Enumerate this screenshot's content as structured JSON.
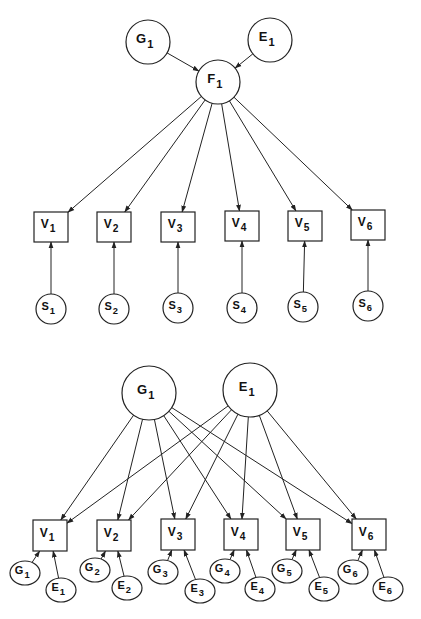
{
  "diagram_top": {
    "title": "Single-factor model",
    "latent": [
      {
        "id": "G1",
        "base": "G",
        "sub": "1",
        "cx": 148,
        "cy": 42,
        "rx": 22,
        "ry": 22
      },
      {
        "id": "E1",
        "base": "E",
        "sub": "1",
        "cx": 270,
        "cy": 40,
        "rx": 22,
        "ry": 22
      },
      {
        "id": "F1",
        "base": "F",
        "sub": "1",
        "cx": 218,
        "cy": 82,
        "rx": 22,
        "ry": 22
      }
    ],
    "observed": [
      {
        "id": "V1",
        "base": "V",
        "sub": "1",
        "cx": 51,
        "y": 212,
        "w": 34,
        "h": 30
      },
      {
        "id": "V2",
        "base": "V",
        "sub": "2",
        "cx": 114,
        "y": 212,
        "w": 34,
        "h": 30
      },
      {
        "id": "V3",
        "base": "V",
        "sub": "3",
        "cx": 178,
        "y": 212,
        "w": 34,
        "h": 30
      },
      {
        "id": "V4",
        "base": "V",
        "sub": "4",
        "cx": 242,
        "y": 211,
        "w": 34,
        "h": 30
      },
      {
        "id": "V5",
        "base": "V",
        "sub": "5",
        "cx": 305,
        "y": 211,
        "w": 34,
        "h": 30
      },
      {
        "id": "V6",
        "base": "V",
        "sub": "6",
        "cx": 368,
        "y": 210,
        "w": 34,
        "h": 30
      }
    ],
    "specific": [
      {
        "id": "S1",
        "base": "S",
        "sub": "1",
        "cx": 51,
        "cy": 309,
        "r": 15
      },
      {
        "id": "S2",
        "base": "S",
        "sub": "2",
        "cx": 114,
        "cy": 309,
        "r": 15
      },
      {
        "id": "S3",
        "base": "S",
        "sub": "3",
        "cx": 178,
        "cy": 308,
        "r": 15
      },
      {
        "id": "S4",
        "base": "S",
        "sub": "4",
        "cx": 242,
        "cy": 308,
        "r": 15
      },
      {
        "id": "S5",
        "base": "S",
        "sub": "5",
        "cx": 303,
        "cy": 307,
        "r": 15
      },
      {
        "id": "S6",
        "base": "S",
        "sub": "6",
        "cx": 368,
        "cy": 306,
        "r": 15
      }
    ],
    "edges": [
      {
        "from": "G1",
        "to": "F1"
      },
      {
        "from": "E1",
        "to": "F1"
      },
      {
        "from": "F1",
        "to": "V1"
      },
      {
        "from": "F1",
        "to": "V2"
      },
      {
        "from": "F1",
        "to": "V3"
      },
      {
        "from": "F1",
        "to": "V4"
      },
      {
        "from": "F1",
        "to": "V5"
      },
      {
        "from": "F1",
        "to": "V6"
      },
      {
        "from": "S1",
        "to": "V1"
      },
      {
        "from": "S2",
        "to": "V2"
      },
      {
        "from": "S3",
        "to": "V3"
      },
      {
        "from": "S4",
        "to": "V4"
      },
      {
        "from": "S5",
        "to": "V5"
      },
      {
        "from": "S6",
        "to": "V6"
      }
    ]
  },
  "diagram_bottom": {
    "title": "Two-factor (G, E) model",
    "latent": [
      {
        "id": "G1",
        "base": "G",
        "sub": "1",
        "cx": 149,
        "cy": 393,
        "rx": 27,
        "ry": 27
      },
      {
        "id": "E1",
        "base": "E",
        "sub": "1",
        "cx": 250,
        "cy": 390,
        "rx": 27,
        "ry": 27
      }
    ],
    "observed": [
      {
        "id": "V1",
        "base": "V",
        "sub": "1",
        "cx": 50,
        "y": 520,
        "w": 34,
        "h": 31
      },
      {
        "id": "V2",
        "base": "V",
        "sub": "2",
        "cx": 114,
        "y": 520,
        "w": 34,
        "h": 31
      },
      {
        "id": "V3",
        "base": "V",
        "sub": "3",
        "cx": 178,
        "y": 519,
        "w": 34,
        "h": 31
      },
      {
        "id": "V4",
        "base": "V",
        "sub": "4",
        "cx": 241,
        "y": 519,
        "w": 34,
        "h": 31
      },
      {
        "id": "V5",
        "base": "V",
        "sub": "5",
        "cx": 303,
        "y": 519,
        "w": 34,
        "h": 31
      },
      {
        "id": "V6",
        "base": "V",
        "sub": "6",
        "cx": 369,
        "y": 519,
        "w": 34,
        "h": 31
      }
    ],
    "residual_g": [
      {
        "id": "G1r",
        "base": "G",
        "sub": "1",
        "cx": 25,
        "cy": 573,
        "rx": 15,
        "ry": 12
      },
      {
        "id": "G2r",
        "base": "G",
        "sub": "2",
        "cx": 95,
        "cy": 570,
        "rx": 15,
        "ry": 12
      },
      {
        "id": "G3r",
        "base": "G",
        "sub": "3",
        "cx": 163,
        "cy": 572,
        "rx": 15,
        "ry": 12
      },
      {
        "id": "G4r",
        "base": "G",
        "sub": "4",
        "cx": 225,
        "cy": 571,
        "rx": 15,
        "ry": 12
      },
      {
        "id": "G5r",
        "base": "G",
        "sub": "5",
        "cx": 287,
        "cy": 571,
        "rx": 15,
        "ry": 12
      },
      {
        "id": "G6r",
        "base": "G",
        "sub": "6",
        "cx": 353,
        "cy": 572,
        "rx": 15,
        "ry": 12
      }
    ],
    "residual_e": [
      {
        "id": "E1r",
        "base": "E",
        "sub": "1",
        "cx": 61,
        "cy": 590,
        "rx": 15,
        "ry": 12
      },
      {
        "id": "E2r",
        "base": "E",
        "sub": "2",
        "cx": 127,
        "cy": 588,
        "rx": 15,
        "ry": 12
      },
      {
        "id": "E3r",
        "base": "E",
        "sub": "3",
        "cx": 200,
        "cy": 591,
        "rx": 15,
        "ry": 12
      },
      {
        "id": "E4r",
        "base": "E",
        "sub": "4",
        "cx": 260,
        "cy": 589,
        "rx": 15,
        "ry": 12
      },
      {
        "id": "E5r",
        "base": "E",
        "sub": "5",
        "cx": 324,
        "cy": 589,
        "rx": 15,
        "ry": 12
      },
      {
        "id": "E6r",
        "base": "E",
        "sub": "6",
        "cx": 388,
        "cy": 589,
        "rx": 15,
        "ry": 12
      }
    ],
    "edges": [
      {
        "from": "G1",
        "to": "V1"
      },
      {
        "from": "G1",
        "to": "V2"
      },
      {
        "from": "G1",
        "to": "V3"
      },
      {
        "from": "G1",
        "to": "V4"
      },
      {
        "from": "G1",
        "to": "V5"
      },
      {
        "from": "G1",
        "to": "V6"
      },
      {
        "from": "E1",
        "to": "V1"
      },
      {
        "from": "E1",
        "to": "V2"
      },
      {
        "from": "E1",
        "to": "V3"
      },
      {
        "from": "E1",
        "to": "V4"
      },
      {
        "from": "E1",
        "to": "V5"
      },
      {
        "from": "E1",
        "to": "V6"
      },
      {
        "from": "G1r",
        "to": "V1"
      },
      {
        "from": "E1r",
        "to": "V1"
      },
      {
        "from": "G2r",
        "to": "V2"
      },
      {
        "from": "E2r",
        "to": "V2"
      },
      {
        "from": "G3r",
        "to": "V3"
      },
      {
        "from": "E3r",
        "to": "V3"
      },
      {
        "from": "G4r",
        "to": "V4"
      },
      {
        "from": "E4r",
        "to": "V4"
      },
      {
        "from": "G5r",
        "to": "V5"
      },
      {
        "from": "E5r",
        "to": "V5"
      },
      {
        "from": "G6r",
        "to": "V6"
      },
      {
        "from": "E6r",
        "to": "V6"
      }
    ]
  },
  "style": {
    "stroke": "#222222",
    "background": "#ffffff"
  }
}
